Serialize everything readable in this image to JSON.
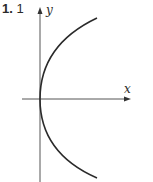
{
  "problem": {
    "number": "1.",
    "answer": "1"
  },
  "axes": {
    "x_label": "x",
    "y_label": "y"
  },
  "colors": {
    "stroke": "#2a2a2a",
    "axis": "#555555"
  },
  "curve": {
    "description": "Parabola opening right with vertex at origin (x = y^2 shape)"
  }
}
